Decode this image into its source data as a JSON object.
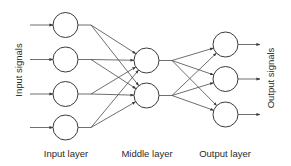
{
  "colors": {
    "stroke": "#3a3a3a",
    "text": "#2a2a2a",
    "background": "#ffffff"
  },
  "labels": {
    "input_signals": "Input signals",
    "output_signals": "Output signals",
    "input_layer": "Input layer",
    "middle_layer": "Middle layer",
    "output_layer": "Output layer"
  },
  "layers": [
    {
      "name": "input",
      "label": "Input layer",
      "node_count": 4,
      "cx": 65.5,
      "cy": [
        25,
        59.5,
        94,
        127.5
      ],
      "r": 12.5
    },
    {
      "name": "middle",
      "label": "Middle layer",
      "node_count": 2,
      "cx": 146.5,
      "cy": [
        60.5,
        95.5
      ],
      "r": 12.5
    },
    {
      "name": "output",
      "label": "Output layer",
      "node_count": 3,
      "cx": 225.5,
      "cy": [
        44.5,
        79,
        114.5
      ],
      "r": 12.5
    }
  ],
  "connections": {
    "input_to_middle": "fully connected (4 x 2)",
    "middle_to_output": "fully connected (2 x 3)"
  }
}
